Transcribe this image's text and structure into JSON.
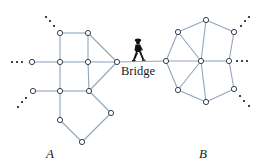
{
  "diagram": {
    "labels": {
      "bridge": "Bridge",
      "region_a": "A",
      "region_b": "B"
    },
    "colors": {
      "edge": "#8fa6bd",
      "node_stroke": "#3a3f45",
      "node_fill": "#ffffff",
      "text": "#1a1a1a"
    },
    "network_a": {
      "nodes": [
        {
          "id": "a1",
          "x": 60,
          "y": 33
        },
        {
          "id": "a2",
          "x": 88,
          "y": 33
        },
        {
          "id": "a3",
          "x": 32,
          "y": 62
        },
        {
          "id": "a4",
          "x": 60,
          "y": 62
        },
        {
          "id": "a5",
          "x": 88,
          "y": 62
        },
        {
          "id": "a6",
          "x": 117,
          "y": 62
        },
        {
          "id": "a7",
          "x": 33,
          "y": 91
        },
        {
          "id": "a8",
          "x": 60,
          "y": 91
        },
        {
          "id": "a9",
          "x": 89,
          "y": 91
        },
        {
          "id": "a10",
          "x": 60,
          "y": 120
        },
        {
          "id": "a11",
          "x": 111,
          "y": 113
        },
        {
          "id": "a12",
          "x": 82,
          "y": 142
        }
      ],
      "edges": [
        [
          "a1",
          "a2"
        ],
        [
          "a1",
          "a4"
        ],
        [
          "a2",
          "a5"
        ],
        [
          "a2",
          "a6"
        ],
        [
          "a3",
          "a4"
        ],
        [
          "a4",
          "a5"
        ],
        [
          "a5",
          "a6"
        ],
        [
          "a4",
          "a8"
        ],
        [
          "a5",
          "a9"
        ],
        [
          "a7",
          "a8"
        ],
        [
          "a8",
          "a9"
        ],
        [
          "a9",
          "a6"
        ],
        [
          "a8",
          "a10"
        ],
        [
          "a9",
          "a11"
        ],
        [
          "a10",
          "a12"
        ],
        [
          "a11",
          "a12"
        ]
      ]
    },
    "network_b": {
      "nodes": [
        {
          "id": "b1",
          "x": 206,
          "y": 20
        },
        {
          "id": "b2",
          "x": 178,
          "y": 32
        },
        {
          "id": "b3",
          "x": 234,
          "y": 32
        },
        {
          "id": "b4",
          "x": 166,
          "y": 61
        },
        {
          "id": "b5",
          "x": 201,
          "y": 61
        },
        {
          "id": "b6",
          "x": 229,
          "y": 61
        },
        {
          "id": "b7",
          "x": 178,
          "y": 90
        },
        {
          "id": "b8",
          "x": 206,
          "y": 102
        },
        {
          "id": "b9",
          "x": 234,
          "y": 89
        }
      ],
      "edges": [
        [
          "b1",
          "b2"
        ],
        [
          "b1",
          "b3"
        ],
        [
          "b1",
          "b5"
        ],
        [
          "b2",
          "b4"
        ],
        [
          "b2",
          "b5"
        ],
        [
          "b3",
          "b6"
        ],
        [
          "b4",
          "b5"
        ],
        [
          "b5",
          "b6"
        ],
        [
          "b4",
          "b7"
        ],
        [
          "b5",
          "b7"
        ],
        [
          "b5",
          "b8"
        ],
        [
          "b7",
          "b8"
        ],
        [
          "b8",
          "b9"
        ],
        [
          "b6",
          "b9"
        ]
      ]
    },
    "bridge": {
      "from": "a6",
      "to": "b4"
    },
    "ellipses": [
      {
        "name": "a-top-left",
        "dots": [
          [
            46,
            17
          ],
          [
            50,
            21
          ],
          [
            54,
            26
          ]
        ]
      },
      {
        "name": "a-left",
        "dots": [
          [
            12,
            62
          ],
          [
            17,
            62
          ],
          [
            22,
            62
          ]
        ]
      },
      {
        "name": "a-lower-left",
        "dots": [
          [
            18,
            107
          ],
          [
            22,
            102
          ],
          [
            26,
            98
          ]
        ]
      },
      {
        "name": "b-top-right",
        "dots": [
          [
            241,
            26
          ],
          [
            245,
            21
          ],
          [
            249,
            17
          ]
        ]
      },
      {
        "name": "b-right",
        "dots": [
          [
            237,
            61
          ],
          [
            242,
            61
          ],
          [
            247,
            61
          ]
        ]
      },
      {
        "name": "b-lower-right",
        "dots": [
          [
            240,
            96
          ],
          [
            244,
            101
          ],
          [
            249,
            106
          ]
        ]
      }
    ]
  }
}
